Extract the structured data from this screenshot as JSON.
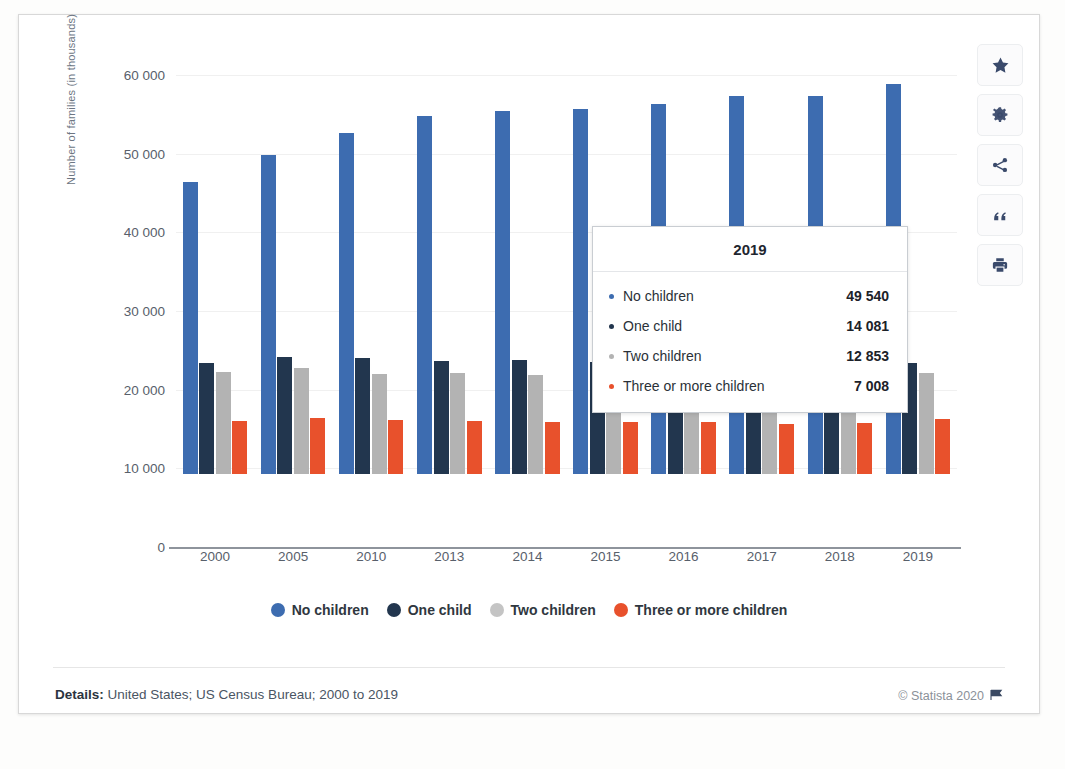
{
  "chart_data": {
    "type": "bar",
    "title": "",
    "xlabel": "",
    "ylabel": "Number of families (in thousands)",
    "ylim": [
      0,
      60000
    ],
    "yticks": [
      "0",
      "10 000",
      "20 000",
      "30 000",
      "40 000",
      "50 000",
      "60 000"
    ],
    "ytick_values": [
      0,
      10000,
      20000,
      30000,
      40000,
      50000,
      60000
    ],
    "grid": true,
    "legend_position": "bottom",
    "categories": [
      "2000",
      "2005",
      "2010",
      "2013",
      "2014",
      "2015",
      "2016",
      "2017",
      "2018",
      "2019"
    ],
    "series": [
      {
        "name": "No children",
        "color": "#3d6cb0",
        "values": [
          37150,
          40500,
          43350,
          45550,
          46150,
          46450,
          47000,
          48000,
          48100,
          49540
        ]
      },
      {
        "name": "One child",
        "color": "#22364e",
        "values": [
          14050,
          14900,
          14800,
          14400,
          14500,
          14200,
          14100,
          14150,
          14200,
          14081
        ]
      },
      {
        "name": "Two children",
        "color": "#b3b3b3",
        "values": [
          12950,
          13500,
          12700,
          12800,
          12600,
          12900,
          12850,
          12900,
          12800,
          12853
        ]
      },
      {
        "name": "Three or more children",
        "color": "#e8512c",
        "values": [
          6800,
          7150,
          6900,
          6750,
          6650,
          6600,
          6550,
          6300,
          6500,
          7008
        ]
      }
    ]
  },
  "tooltip": {
    "title": "2019",
    "rows": [
      {
        "label": "No children",
        "value": "49 540",
        "series": 0
      },
      {
        "label": "One child",
        "value": "14 081",
        "series": 1
      },
      {
        "label": "Two children",
        "value": "12 853",
        "series": 2
      },
      {
        "label": "Three or more children",
        "value": "7 008",
        "series": 3
      }
    ]
  },
  "footer": {
    "details_label": "Details:",
    "details_text": "United States; US Census Bureau; 2000 to 2019",
    "copyright": "© Statista 2020"
  },
  "toolbar": {
    "items": [
      {
        "name": "favorite-star-icon",
        "label": "Favorite"
      },
      {
        "name": "settings-gear-icon",
        "label": "Settings"
      },
      {
        "name": "share-icon",
        "label": "Share"
      },
      {
        "name": "quote-icon",
        "label": "Cite"
      },
      {
        "name": "print-icon",
        "label": "Print"
      }
    ]
  }
}
